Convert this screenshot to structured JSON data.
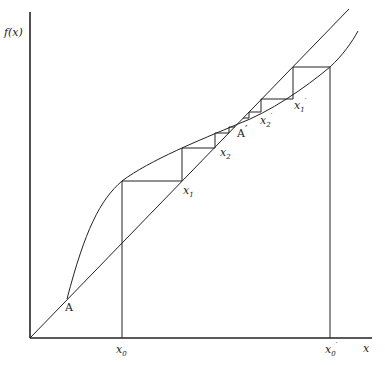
{
  "diagram": {
    "type": "cobweb-fixed-point-iteration",
    "axes": {
      "y_label": "f(x)",
      "x_label": "x"
    },
    "labels": {
      "point_A": "A",
      "point_A_prime": "A",
      "prime": "′",
      "x0": "x",
      "x0_sub": "0",
      "x0p": "x",
      "x0p_sub": "0",
      "x1": "x",
      "x1_sub": "1",
      "x2": "x",
      "x2_sub": "2",
      "x1p": "x",
      "x1p_sub": "1",
      "x2p": "x",
      "x2p_sub": "2"
    },
    "curves": [
      "y = x (diagonal)",
      "y = f(x)"
    ],
    "colors": {
      "line": "#222222",
      "background": "#ffffff"
    }
  }
}
